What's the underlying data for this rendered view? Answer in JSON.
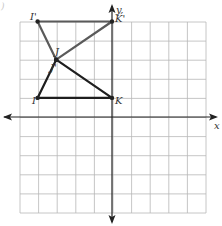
{
  "figure": {
    "corner_mark": ")",
    "grid": {
      "cols": 10,
      "rows": 10,
      "left": 20,
      "top": 22,
      "right": 206,
      "bottom": 213,
      "origin_px": [
        112,
        117
      ],
      "unit_x": 18.6,
      "unit_y": 19.1,
      "line_color": "#b8b8b8",
      "axis_color": "#222222"
    },
    "axes": {
      "x_label": "x",
      "y_label": "y,"
    },
    "original_triangle": {
      "color": "#1e1e1e",
      "vertices": [
        {
          "name": "I",
          "coord": [
            -4,
            1
          ]
        },
        {
          "name": "J",
          "coord": [
            -3,
            3
          ]
        },
        {
          "name": "K",
          "coord": [
            0,
            1
          ]
        }
      ]
    },
    "image_triangle": {
      "color": "#5a5a5a",
      "vertices": [
        {
          "name": "I'",
          "coord": [
            -4,
            5
          ]
        },
        {
          "name": "J'",
          "coord": [
            -3,
            3
          ]
        },
        {
          "name": "K'",
          "coord": [
            0,
            5
          ]
        }
      ]
    },
    "labels": [
      {
        "text": "I'",
        "x": 30,
        "y": 20
      },
      {
        "text": "K'",
        "x": 115,
        "y": 22
      },
      {
        "text": "J",
        "x": 55,
        "y": 55
      },
      {
        "text": "J'",
        "x": 50,
        "y": 71
      },
      {
        "text": "I",
        "x": 32,
        "y": 104
      },
      {
        "text": "K",
        "x": 115,
        "y": 104
      }
    ]
  }
}
